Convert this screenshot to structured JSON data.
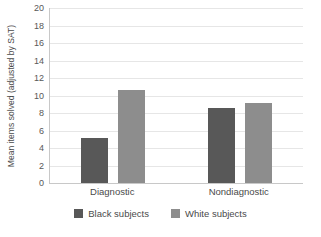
{
  "chart_data": {
    "type": "bar",
    "title": "",
    "xlabel": "",
    "ylabel": "Mean items solved (adjusted by SAT)",
    "categories": [
      "Diagnostic",
      "Nondiagnostic"
    ],
    "series": [
      {
        "name": "Black subjects",
        "color": "#585858",
        "values": [
          5.1,
          8.6
        ]
      },
      {
        "name": "White subjects",
        "color": "#8d8d8d",
        "values": [
          10.6,
          9.1
        ]
      }
    ],
    "ylim": [
      0,
      20
    ],
    "ytick_step": 2,
    "ytick_labels": [
      "20",
      "18",
      "16",
      "14",
      "12",
      "10",
      "8",
      "6",
      "4",
      "2",
      "0"
    ],
    "grid": true,
    "grid_color": "#e6e6e6",
    "axis_color": "#c8c8c8",
    "legend_position": "bottom",
    "background": "#ffffff"
  }
}
